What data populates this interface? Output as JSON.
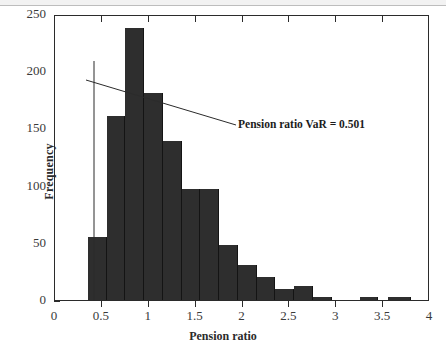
{
  "chart_data": {
    "type": "bar",
    "title": "",
    "subtitle": "",
    "xlabel": "Pension ratio",
    "ylabel": "Frequency",
    "xlim": [
      0,
      4
    ],
    "ylim": [
      0,
      250
    ],
    "xticks": [
      "0",
      "0.5",
      "1",
      "1.5",
      "2",
      "2.5",
      "3",
      "3.5",
      "4"
    ],
    "xtick_values": [
      0,
      0.5,
      1,
      1.5,
      2,
      2.5,
      3,
      3.5,
      4
    ],
    "yticks": [
      "0",
      "50",
      "100",
      "150",
      "200",
      "250"
    ],
    "ytick_values": [
      0,
      50,
      100,
      150,
      200,
      250
    ],
    "grid": false,
    "legend": null,
    "bin_width": 0.2,
    "bar_color": "#2e2e2e",
    "bins": [
      {
        "start": 0.35,
        "end": 0.55,
        "value": 55
      },
      {
        "start": 0.55,
        "end": 0.75,
        "value": 161
      },
      {
        "start": 0.75,
        "end": 0.95,
        "value": 238
      },
      {
        "start": 0.95,
        "end": 1.15,
        "value": 181
      },
      {
        "start": 1.15,
        "end": 1.35,
        "value": 139
      },
      {
        "start": 1.35,
        "end": 1.55,
        "value": 97
      },
      {
        "start": 1.55,
        "end": 1.75,
        "value": 97
      },
      {
        "start": 1.75,
        "end": 1.95,
        "value": 48
      },
      {
        "start": 1.95,
        "end": 2.15,
        "value": 31
      },
      {
        "start": 2.15,
        "end": 2.35,
        "value": 20
      },
      {
        "start": 2.35,
        "end": 2.55,
        "value": 10
      },
      {
        "start": 2.55,
        "end": 2.75,
        "value": 12
      },
      {
        "start": 2.75,
        "end": 2.95,
        "value": 3
      },
      {
        "start": 3.25,
        "end": 3.45,
        "value": 3
      },
      {
        "start": 3.55,
        "end": 3.8,
        "value": 3
      }
    ],
    "annotations": [
      {
        "text": "Pension ratio VaR = 0.501",
        "kind": "label-with-leader-line",
        "x": 0.501
      }
    ],
    "reference_lines": [
      {
        "kind": "vertical",
        "x": 0.501,
        "y_from": 0,
        "y_to": 208
      },
      {
        "kind": "sloped-leader",
        "from": {
          "x": 0.42,
          "y": 197
        },
        "to": {
          "x": 1.95,
          "y": 157
        }
      }
    ]
  },
  "axis": {
    "y_label": "Frequency",
    "x_label": "Pension ratio"
  },
  "annotation": {
    "var_text": "Pension ratio VaR = 0.501"
  }
}
